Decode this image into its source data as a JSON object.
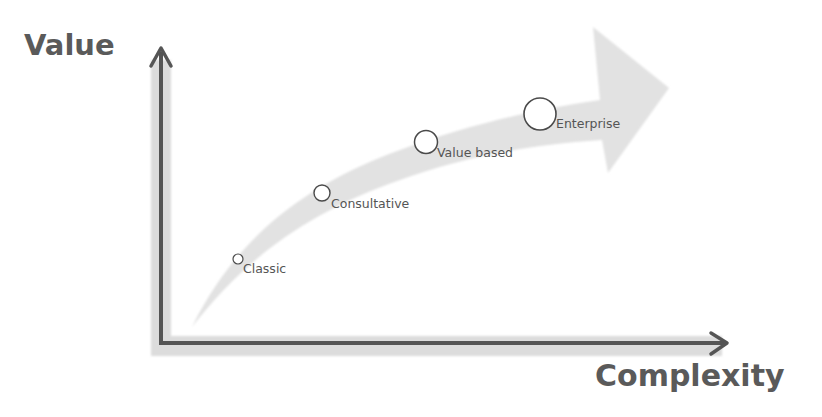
{
  "diagram": {
    "type": "maturity-curve",
    "y_axis_label": "Value",
    "x_axis_label": "Complexity",
    "stages": [
      {
        "label": "Classic",
        "cx": 238,
        "cy": 259,
        "r": 5
      },
      {
        "label": "Consultative",
        "cx": 322,
        "cy": 193,
        "r": 8
      },
      {
        "label": "Value based",
        "cx": 426,
        "cy": 142,
        "r": 12
      },
      {
        "label": "Enterprise",
        "cx": 540,
        "cy": 114,
        "r": 16
      }
    ],
    "colors": {
      "axis": "#555555",
      "axis_shadow": "#d4d4d4",
      "curve_fill": "#e2e2e2",
      "text": "#555555",
      "circle_stroke": "#4a4a4a"
    }
  }
}
